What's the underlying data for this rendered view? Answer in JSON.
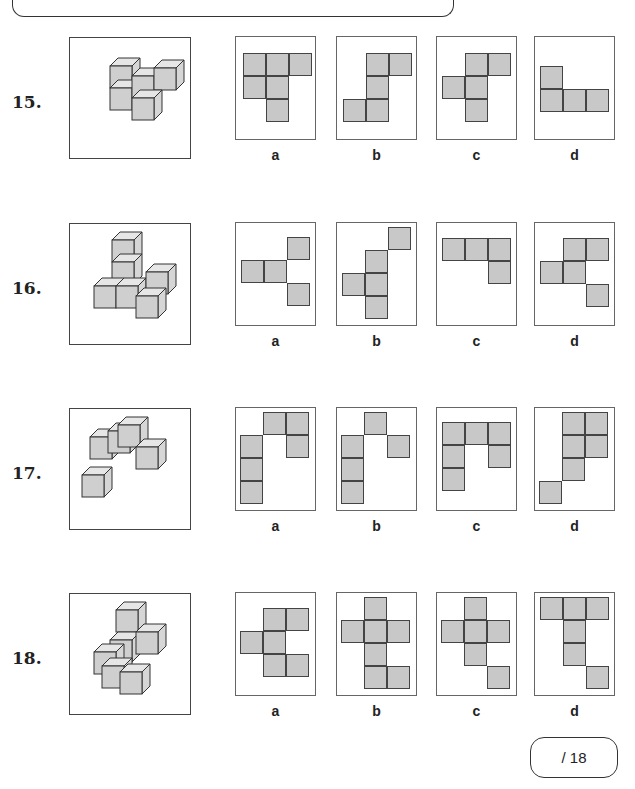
{
  "header": {
    "banner": ""
  },
  "questions": [
    {
      "number": "15.",
      "options": [
        {
          "label": "a",
          "cells": [
            [
              0,
              0
            ],
            [
              1,
              0
            ],
            [
              2,
              0
            ],
            [
              0,
              1
            ],
            [
              1,
              1
            ],
            [
              1,
              2
            ]
          ]
        },
        {
          "label": "b",
          "cells": [
            [
              1,
              0
            ],
            [
              2,
              0
            ],
            [
              1,
              1
            ],
            [
              0,
              2
            ],
            [
              1,
              2
            ]
          ]
        },
        {
          "label": "c",
          "cells": [
            [
              1,
              0
            ],
            [
              2,
              0
            ],
            [
              0,
              1
            ],
            [
              1,
              1
            ],
            [
              1,
              2
            ]
          ]
        },
        {
          "label": "d",
          "cells": [
            [
              0,
              0
            ],
            [
              0,
              1
            ],
            [
              1,
              1
            ],
            [
              2,
              1
            ]
          ]
        }
      ]
    },
    {
      "number": "16.",
      "options": [
        {
          "label": "a",
          "cells": [
            [
              2,
              0
            ],
            [
              0,
              1
            ],
            [
              1,
              1
            ],
            [
              2,
              2
            ]
          ]
        },
        {
          "label": "b",
          "cells": [
            [
              2,
              0
            ],
            [
              1,
              1
            ],
            [
              0,
              2
            ],
            [
              1,
              2
            ],
            [
              1,
              3
            ]
          ]
        },
        {
          "label": "c",
          "cells": [
            [
              0,
              0
            ],
            [
              1,
              0
            ],
            [
              2,
              0
            ],
            [
              2,
              1
            ]
          ]
        },
        {
          "label": "d",
          "cells": [
            [
              1,
              0
            ],
            [
              2,
              0
            ],
            [
              0,
              1
            ],
            [
              1,
              1
            ],
            [
              2,
              2
            ]
          ]
        }
      ]
    },
    {
      "number": "17.",
      "options": [
        {
          "label": "a",
          "cells": [
            [
              1,
              0
            ],
            [
              2,
              0
            ],
            [
              0,
              1
            ],
            [
              2,
              1
            ],
            [
              0,
              2
            ],
            [
              0,
              3
            ]
          ]
        },
        {
          "label": "b",
          "cells": [
            [
              1,
              0
            ],
            [
              0,
              1
            ],
            [
              2,
              1
            ],
            [
              0,
              2
            ],
            [
              0,
              3
            ]
          ]
        },
        {
          "label": "c",
          "cells": [
            [
              0,
              0
            ],
            [
              1,
              0
            ],
            [
              2,
              0
            ],
            [
              0,
              1
            ],
            [
              2,
              1
            ],
            [
              0,
              2
            ]
          ]
        },
        {
          "label": "d",
          "cells": [
            [
              1,
              0
            ],
            [
              2,
              0
            ],
            [
              1,
              1
            ],
            [
              2,
              1
            ],
            [
              1,
              2
            ],
            [
              0,
              3
            ]
          ]
        }
      ]
    },
    {
      "number": "18.",
      "options": [
        {
          "label": "a",
          "cells": [
            [
              1,
              0
            ],
            [
              2,
              0
            ],
            [
              0,
              1
            ],
            [
              1,
              1
            ],
            [
              1,
              2
            ],
            [
              2,
              2
            ]
          ]
        },
        {
          "label": "b",
          "cells": [
            [
              1,
              0
            ],
            [
              0,
              1
            ],
            [
              1,
              1
            ],
            [
              2,
              1
            ],
            [
              1,
              2
            ],
            [
              1,
              3
            ],
            [
              2,
              3
            ]
          ]
        },
        {
          "label": "c",
          "cells": [
            [
              1,
              0
            ],
            [
              0,
              1
            ],
            [
              1,
              1
            ],
            [
              2,
              1
            ],
            [
              1,
              2
            ],
            [
              2,
              3
            ]
          ]
        },
        {
          "label": "d",
          "cells": [
            [
              0,
              0
            ],
            [
              1,
              0
            ],
            [
              2,
              0
            ],
            [
              1,
              1
            ],
            [
              1,
              2
            ],
            [
              2,
              3
            ]
          ]
        }
      ]
    }
  ],
  "score": {
    "text": "/ 18"
  },
  "colors": {
    "cell_fill": "#c8c8c8",
    "cell_border": "#444444",
    "panel_border": "#666666"
  }
}
